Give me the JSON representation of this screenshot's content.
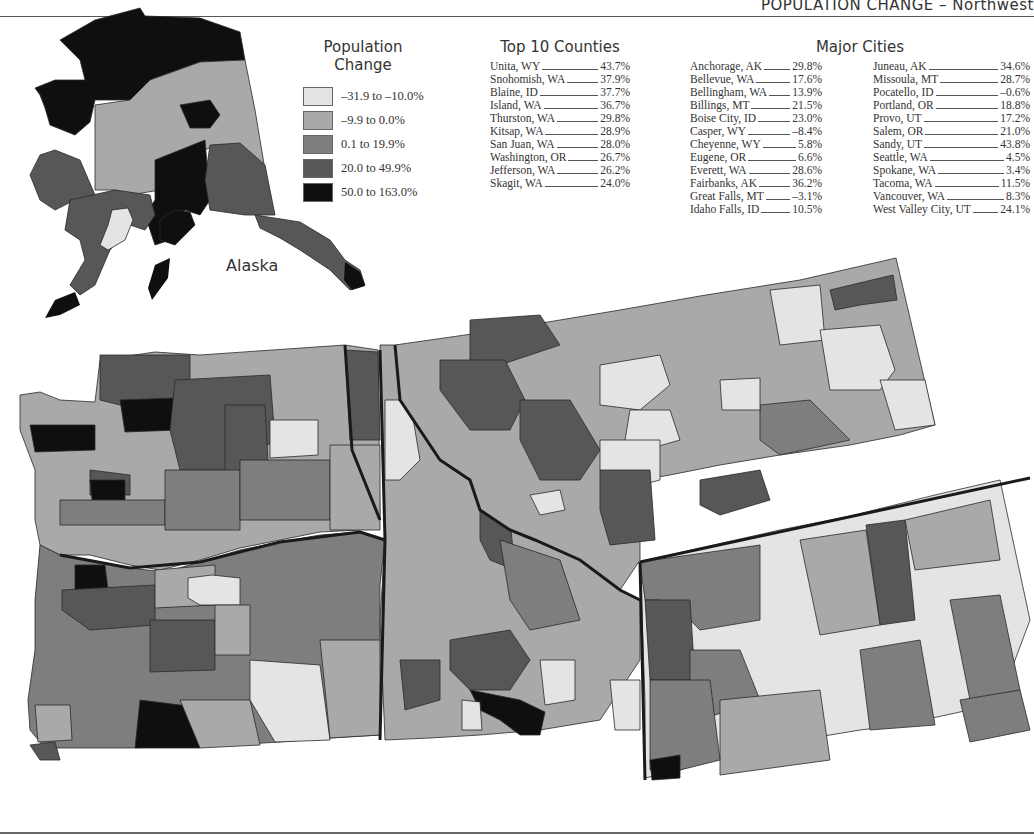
{
  "header": {
    "title": "POPULATION CHANGE – Northwest"
  },
  "legend": {
    "title_line1": "Population",
    "title_line2": "Change",
    "items": [
      {
        "label": "–31.9 to –10.0%",
        "color": "#e4e4e4"
      },
      {
        "label": "–9.9 to 0.0%",
        "color": "#a9a9a9"
      },
      {
        "label": "0.1 to 19.9%",
        "color": "#7e7e7e"
      },
      {
        "label": "20.0 to 49.9%",
        "color": "#575757"
      },
      {
        "label": "50.0 to 163.0%",
        "color": "#0f0f0f"
      }
    ]
  },
  "top_counties": {
    "title": "Top 10 Counties",
    "rows": [
      {
        "name": "Unita, WY",
        "value": "43.7%"
      },
      {
        "name": "Snohomish, WA",
        "value": "37.9%"
      },
      {
        "name": "Blaine, ID",
        "value": "37.7%"
      },
      {
        "name": "Island, WA",
        "value": "36.7%"
      },
      {
        "name": "Thurston, WA",
        "value": "29.8%"
      },
      {
        "name": "Kitsap, WA",
        "value": "28.9%"
      },
      {
        "name": "San Juan, WA",
        "value": "28.0%"
      },
      {
        "name": "Washington, OR",
        "value": "26.7%"
      },
      {
        "name": "Jefferson, WA",
        "value": "26.2%"
      },
      {
        "name": "Skagit, WA",
        "value": "24.0%"
      }
    ]
  },
  "major_cities": {
    "title": "Major Cities",
    "col1": [
      {
        "name": "Anchorage, AK",
        "value": "29.8%"
      },
      {
        "name": "Bellevue, WA",
        "value": "17.6%"
      },
      {
        "name": "Bellingham, WA",
        "value": "13.9%"
      },
      {
        "name": "Billings, MT",
        "value": "21.5%"
      },
      {
        "name": "Boise City, ID",
        "value": "23.0%"
      },
      {
        "name": "Casper, WY",
        "value": "–8.4%"
      },
      {
        "name": "Cheyenne, WY",
        "value": "5.8%"
      },
      {
        "name": "Eugene, OR",
        "value": "6.6%"
      },
      {
        "name": "Everett, WA",
        "value": "28.6%"
      },
      {
        "name": "Fairbanks, AK",
        "value": "36.2%"
      },
      {
        "name": "Great Falls, MT",
        "value": "–3.1%"
      },
      {
        "name": "Idaho Falls, ID",
        "value": "10.5%"
      }
    ],
    "col2": [
      {
        "name": "Juneau, AK",
        "value": "34.6%"
      },
      {
        "name": "Missoula, MT",
        "value": "28.7%"
      },
      {
        "name": "Pocatello, ID",
        "value": "–0.6%"
      },
      {
        "name": "Portland, OR",
        "value": "18.8%"
      },
      {
        "name": "Provo, UT",
        "value": "17.2%"
      },
      {
        "name": "Salem, OR",
        "value": "21.0%"
      },
      {
        "name": "Sandy, UT",
        "value": "43.8%"
      },
      {
        "name": "Seattle, WA",
        "value": "4.5%"
      },
      {
        "name": "Spokane, WA",
        "value": "3.4%"
      },
      {
        "name": "Tacoma, WA",
        "value": "11.5%"
      },
      {
        "name": "Vancouver, WA",
        "value": "8.3%"
      },
      {
        "name": "West Valley City, UT",
        "value": "24.1%"
      }
    ]
  },
  "map": {
    "alaska_label": "Alaska",
    "states": [
      "Alaska",
      "Washington",
      "Oregon",
      "Idaho",
      "Montana",
      "Wyoming"
    ]
  }
}
